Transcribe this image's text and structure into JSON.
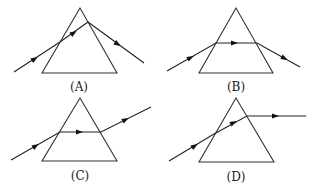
{
  "figure": {
    "panels": [
      {
        "id": "A",
        "label": "(A)",
        "label_pos": [
          79,
          81
        ],
        "prism": [
          [
            80,
            8
          ],
          [
            42,
            73
          ],
          [
            117,
            73
          ]
        ],
        "ray": [
          [
            14,
            72
          ],
          [
            60,
            42
          ],
          [
            88,
            22
          ],
          [
            144,
            63
          ]
        ],
        "arrows": [
          [
            [
              30,
              62
            ],
            [
              36,
              58
            ]
          ],
          [
            [
              69,
              36
            ],
            [
              75,
              32
            ]
          ],
          [
            [
              113,
              41
            ],
            [
              119,
              45
            ]
          ]
        ]
      },
      {
        "id": "B",
        "label": "(B)",
        "label_pos": [
          236,
          81
        ],
        "prism": [
          [
            236,
            8
          ],
          [
            199,
            73
          ],
          [
            273,
            73
          ]
        ],
        "ray": [
          [
            167,
            71
          ],
          [
            216,
            43
          ],
          [
            257,
            43
          ],
          [
            300,
            67
          ]
        ],
        "arrows": [
          [
            [
              186,
              60
            ],
            [
              192,
              57
            ]
          ],
          [
            [
              229,
              43
            ],
            [
              236,
              43
            ]
          ],
          [
            [
              280,
              56
            ],
            [
              286,
              59
            ]
          ]
        ]
      },
      {
        "id": "C",
        "label": "(C)",
        "label_pos": [
          80,
          170
        ],
        "prism": [
          [
            80,
            98
          ],
          [
            42,
            161
          ],
          [
            117,
            161
          ]
        ],
        "ray": [
          [
            11,
            160
          ],
          [
            60,
            132
          ],
          [
            101,
            132
          ],
          [
            151,
            107
          ]
        ],
        "arrows": [
          [
            [
              31,
              149
            ],
            [
              37,
              145
            ]
          ],
          [
            [
              74,
              132
            ],
            [
              81,
              132
            ]
          ],
          [
            [
              121,
              122
            ],
            [
              127,
              119
            ]
          ]
        ]
      },
      {
        "id": "D",
        "label": "(D)",
        "label_pos": [
          236,
          171
        ],
        "prism": [
          [
            236,
            98
          ],
          [
            199,
            162
          ],
          [
            274,
            162
          ]
        ],
        "ray": [
          [
            169,
            161
          ],
          [
            214,
            134
          ],
          [
            247,
            116
          ],
          [
            306,
            116
          ]
        ],
        "arrows": [
          [
            [
              190,
              149
            ],
            [
              196,
              145
            ]
          ],
          [
            [
              229,
              125
            ],
            [
              235,
              122
            ]
          ],
          [
            [
              270,
              116
            ],
            [
              277,
              116
            ]
          ]
        ]
      }
    ],
    "colors": {
      "stroke": "#333333",
      "arrow": "#111111",
      "background": "#ffffff"
    }
  }
}
